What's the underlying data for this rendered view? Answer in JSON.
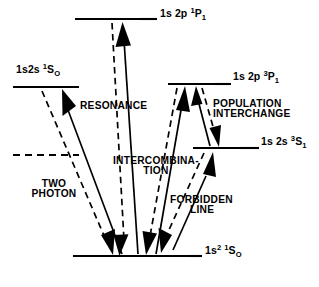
{
  "figure": {
    "type": "energy-level-diagram",
    "background_color": "#ffffff",
    "line_color": "#000000"
  },
  "levels": [
    {
      "id": "1s2p-1P1",
      "label_plain": "1s 2p 1P1",
      "label_base": "1s 2p ",
      "label_sup": "1",
      "label_letter": "P",
      "label_sub": "1",
      "style": "solid",
      "x1": 75,
      "x2": 140,
      "y": 19,
      "label_x": 160,
      "label_y": 12,
      "tick_x1": 140,
      "tick_x2": 157
    },
    {
      "id": "1s2s-1S0",
      "label_plain": "1s 2s 1S0",
      "label_base": "1s2s ",
      "label_sup": "1",
      "label_letter": "S",
      "label_sub": "O",
      "style": "solid",
      "x1": 13,
      "x2": 79,
      "y": 87,
      "label_x": 16,
      "label_y": 68,
      "tick_x1": 0,
      "tick_x2": 0
    },
    {
      "id": "1s2p-3P1",
      "label_plain": "1s 2p 3P1",
      "label_base": "1s 2p ",
      "label_sup": "3",
      "label_letter": "P",
      "label_sub": "1",
      "style": "solid",
      "x1": 168,
      "x2": 215,
      "y": 84,
      "label_x": 219,
      "label_y": 74,
      "tick_x1": 215,
      "tick_x2": 231
    },
    {
      "id": "1s2s-3S1",
      "label_plain": "1s 2s 3S1",
      "label_base": "1s 2s ",
      "label_sup": "3",
      "label_letter": "S",
      "label_sub": "1",
      "style": "solid",
      "x1": 193,
      "x2": 240,
      "y": 148,
      "label_x": 252,
      "label_y": 139,
      "tick_x1": 240,
      "tick_x2": 259
    },
    {
      "id": "metastable-dashed",
      "label_plain": "",
      "label_base": "",
      "label_sup": "",
      "label_letter": "",
      "label_sub": "",
      "style": "dashed",
      "x1": 13,
      "x2": 79,
      "y": 155,
      "label_x": 0,
      "label_y": 0,
      "tick_x1": 0,
      "tick_x2": 0
    },
    {
      "id": "1s2-1S0-ground",
      "label_plain": "1s2 1S0",
      "label_base": "1s",
      "label_sup_base": "2",
      "label_sup": "1",
      "label_letter": "S",
      "label_sub": "O",
      "style": "solid",
      "x1": 73,
      "x2": 190,
      "y": 256,
      "label_x": 204,
      "label_y": 248,
      "tick_x1": 190,
      "tick_x2": 202
    }
  ],
  "process_labels": [
    {
      "id": "resonance",
      "line1": "RESONANCE",
      "line2": "",
      "x": 80,
      "y": 101,
      "align": "left"
    },
    {
      "id": "population-interchange",
      "line1": "POPULATION",
      "line2": "INTERCHANGE",
      "x": 213,
      "y": 100,
      "align": "left"
    },
    {
      "id": "intercombination",
      "line1": "INTERCOMBINA-",
      "line2": "TION",
      "x": 114,
      "y": 157,
      "align": "left"
    },
    {
      "id": "two-photon",
      "line1": "TWO",
      "line2": "PHOTON",
      "x": 21,
      "y": 180,
      "align": "left"
    },
    {
      "id": "forbidden-line",
      "line1": "FORBIDDEN",
      "line2": "LINE",
      "x": 171,
      "y": 196,
      "align": "left"
    }
  ],
  "transitions": [
    {
      "id": "resonance-emission-dashed",
      "style": "dashed",
      "x1": 111,
      "y1": 26,
      "x2": 125,
      "y2": 248,
      "arrow": "end",
      "arrow_dir": "down"
    },
    {
      "id": "resonance-excitation-solid",
      "style": "solid",
      "x1": 137,
      "y1": 248,
      "x2": 121,
      "y2": 26,
      "arrow": "start",
      "arrow_dir": "up"
    },
    {
      "id": "two-photon-emission-dashed",
      "style": "dashed",
      "x1": 42,
      "y1": 94,
      "x2": 108,
      "y2": 248,
      "arrow": "end",
      "arrow_dir": "down"
    },
    {
      "id": "two-photon-excitation-solid",
      "style": "solid",
      "x1": 117,
      "y1": 248,
      "x2": 58,
      "y2": 92,
      "arrow": "start",
      "arrow_dir": "up"
    },
    {
      "id": "intercombination-emission-dashed",
      "style": "dashed",
      "x1": 178,
      "y1": 92,
      "x2": 148,
      "y2": 248,
      "arrow": "end",
      "arrow_dir": "down"
    },
    {
      "id": "intercombination-excitation-solid",
      "style": "solid",
      "x1": 155,
      "y1": 248,
      "x2": 186,
      "y2": 92,
      "arrow": "start",
      "arrow_dir": "up"
    },
    {
      "id": "population-interchange-down",
      "style": "dashed",
      "x1": 203,
      "y1": 92,
      "x2": 219,
      "y2": 142,
      "arrow": "end",
      "arrow_dir": "down"
    },
    {
      "id": "population-interchange-up",
      "style": "solid",
      "x1": 212,
      "y1": 142,
      "x2": 197,
      "y2": 92,
      "arrow": "start",
      "arrow_dir": "up"
    },
    {
      "id": "forbidden-emission-dashed",
      "style": "dashed",
      "x1": 205,
      "y1": 156,
      "x2": 162,
      "y2": 250,
      "arrow": "end",
      "arrow_dir": "down"
    },
    {
      "id": "forbidden-excitation-solid",
      "style": "solid",
      "x1": 170,
      "y1": 249,
      "x2": 213,
      "y2": 156,
      "arrow": "start",
      "arrow_dir": "up"
    }
  ]
}
